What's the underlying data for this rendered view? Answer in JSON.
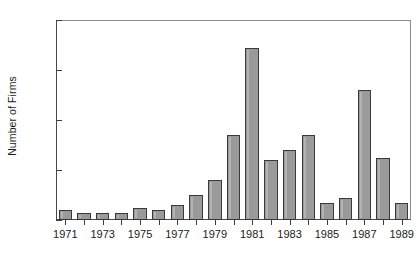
{
  "chart_data": {
    "type": "bar",
    "title": "",
    "subtitle": "",
    "xlabel": "",
    "ylabel": "Number of Firms",
    "categories": [
      "1971",
      "1972",
      "1973",
      "1974",
      "1975",
      "1976",
      "1977",
      "1978",
      "1979",
      "1980",
      "1981",
      "1982",
      "1983",
      "1984",
      "1985",
      "1986",
      "1987",
      "1988",
      "1989"
    ],
    "values": [
      4,
      3,
      3,
      3,
      5,
      4,
      6,
      10,
      16,
      34,
      69,
      24,
      28,
      34,
      7,
      9,
      52,
      25,
      7
    ],
    "xlim": [
      "1971",
      "1989"
    ],
    "ylim": [
      0,
      80
    ],
    "y_ticks": [
      0,
      20,
      40,
      60,
      80
    ],
    "y_tick_labels": [
      "0",
      "20",
      "40",
      "60",
      "80"
    ],
    "x_tick_labels": [
      "1971",
      "1973",
      "1975",
      "1977",
      "1979",
      "1981",
      "1983",
      "1985",
      "1987",
      "1989"
    ],
    "grid": false,
    "legend": null,
    "bar_fill_color": "#9a9a9a",
    "bar_edge_color": "#3a3a3a",
    "axis_color": "#3d3d3d",
    "background_color": "#ffffff",
    "annotations": []
  }
}
